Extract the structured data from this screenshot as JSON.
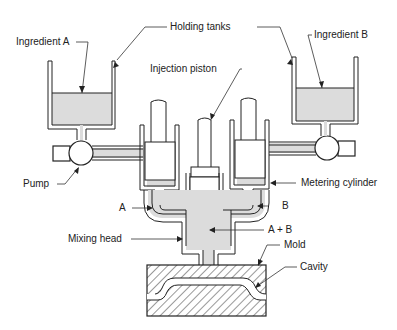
{
  "diagram": {
    "type": "reaction injection molding schematic",
    "labels": {
      "holding_tanks": "Holding tanks",
      "ingredient_a": "Ingredient A",
      "ingredient_b": "Ingredient B",
      "injection_piston": "Injection piston",
      "pump": "Pump",
      "metering_cylinder": "Metering cylinder",
      "a": "A",
      "b": "B",
      "a_plus_b": "A + B",
      "mixing_head": "Mixing head",
      "mold": "Mold",
      "cavity": "Cavity"
    },
    "colors": {
      "line": "#222222",
      "fluid": "#dcdcdc",
      "background": "#ffffff"
    }
  }
}
